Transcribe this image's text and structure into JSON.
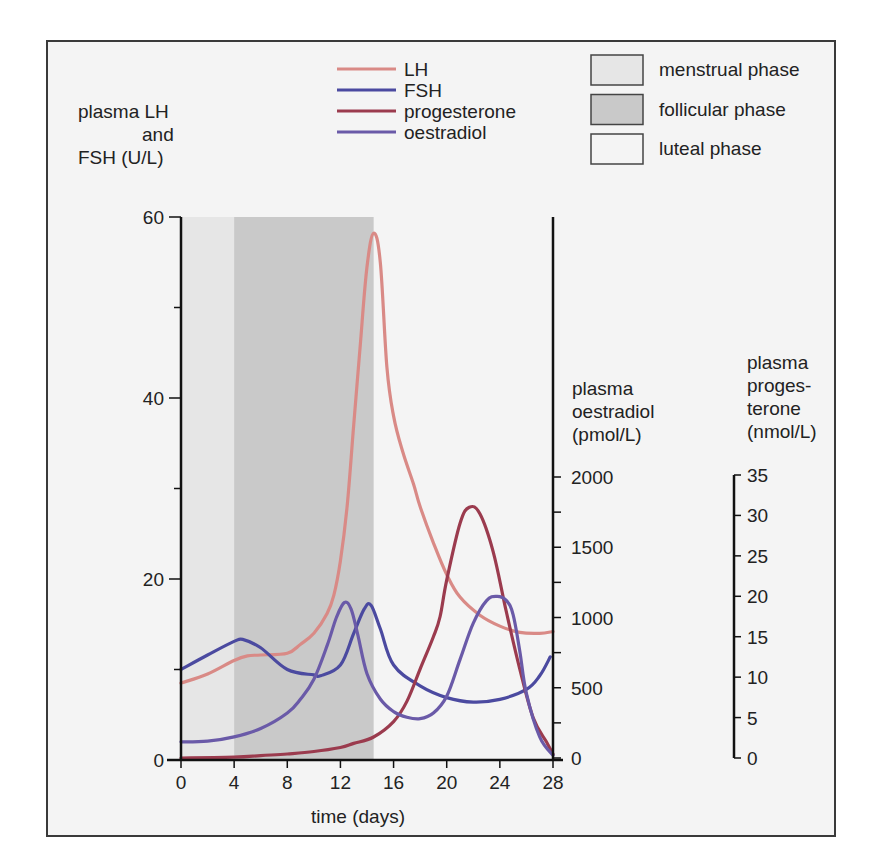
{
  "chart_data": {
    "type": "line",
    "title": "",
    "xlabel": "time (days)",
    "xlim": [
      0,
      28
    ],
    "xticks": [
      0,
      4,
      8,
      12,
      16,
      20,
      24,
      28
    ],
    "axes": {
      "left": {
        "label_lines": [
          "plasma LH",
          "and",
          "FSH (U/L)"
        ],
        "range": [
          0,
          60
        ],
        "ticks": [
          0,
          20,
          40,
          60
        ],
        "minor_ticks": [
          10,
          30,
          50
        ]
      },
      "right_oestradiol": {
        "label_lines": [
          "plasma",
          "oestradiol",
          "(pmol/L)"
        ],
        "range": [
          0,
          2000
        ],
        "ticks": [
          0,
          500,
          1000,
          1500,
          2000
        ],
        "minor_ticks": [
          250,
          750,
          1250,
          1750
        ]
      },
      "right_progesterone": {
        "label_lines": [
          "plasma",
          "proges-",
          "terone",
          "(nmol/L)"
        ],
        "range": [
          0,
          35
        ],
        "ticks": [
          0,
          5,
          10,
          15,
          20,
          25,
          30,
          35
        ]
      }
    },
    "phases": [
      {
        "name": "menstrual phase",
        "start": 0,
        "end": 4,
        "color": "#e6e6e6"
      },
      {
        "name": "follicular phase",
        "start": 4,
        "end": 14.5,
        "color": "#c9c9c9"
      },
      {
        "name": "luteal phase",
        "start": 14.5,
        "end": 28,
        "color": "#f4f4f4"
      }
    ],
    "series": [
      {
        "name": "LH",
        "axis": "left",
        "color": "#d98a86",
        "x": [
          0,
          2,
          4,
          5,
          6,
          8,
          9,
          10,
          11,
          11.5,
          12,
          12.5,
          13,
          13.5,
          14,
          14.5,
          15,
          15.5,
          16,
          16.7,
          17.5,
          18,
          19,
          20,
          21,
          22.5,
          24,
          25.5,
          27,
          28
        ],
        "y": [
          8.5,
          9.5,
          11,
          11.5,
          11.6,
          11.8,
          12.8,
          14,
          16.2,
          18.2,
          22,
          28,
          37,
          46,
          54.5,
          58.2,
          55,
          43.4,
          38,
          34,
          30.5,
          28,
          24,
          20.5,
          18,
          16,
          14.8,
          14.1,
          14,
          14.2
        ]
      },
      {
        "name": "FSH",
        "axis": "left",
        "color": "#4b4aa0",
        "x": [
          0,
          2,
          4,
          4.7,
          6,
          8,
          10,
          10.5,
          12,
          13,
          13.8,
          14.3,
          15,
          16,
          18,
          20,
          22,
          24,
          26,
          27,
          27.8
        ],
        "y": [
          10,
          11.6,
          13.1,
          13.3,
          12.4,
          10,
          9.4,
          9.3,
          10.5,
          14,
          16.7,
          17.1,
          14.5,
          10.5,
          8.2,
          6.9,
          6.4,
          6.7,
          7.8,
          9.3,
          11.4
        ]
      },
      {
        "name": "progesterone",
        "axis": "right_progesterone",
        "color": "#9b3b4e",
        "x": [
          0,
          4,
          6,
          8,
          10,
          12,
          13,
          14.5,
          16,
          17,
          18,
          19,
          19.5,
          20,
          21,
          21.7,
          22.5,
          23.5,
          24.5,
          25.5,
          26.5,
          27.5,
          28
        ],
        "y": [
          0,
          0.1,
          0.3,
          0.5,
          0.8,
          1.3,
          1.8,
          2.6,
          4.5,
          7,
          11,
          15,
          17.5,
          22,
          29,
          31,
          30.2,
          25.5,
          18,
          11,
          5,
          2,
          0.5
        ]
      },
      {
        "name": "oestradiol",
        "axis": "right_oestradiol",
        "color": "#6a5aa8",
        "x": [
          0,
          2,
          4,
          6,
          8,
          9,
          10,
          11,
          11.7,
          12.3,
          12.8,
          13.3,
          14,
          15,
          16,
          17,
          18,
          19,
          20,
          21,
          22,
          23,
          23.8,
          24.5,
          25,
          25.5,
          26,
          27,
          28
        ],
        "y": [
          115,
          120,
          150,
          210,
          320,
          420,
          560,
          800,
          1000,
          1107,
          1060,
          880,
          600,
          420,
          330,
          290,
          280,
          320,
          440,
          700,
          960,
          1120,
          1150,
          1120,
          1020,
          760,
          460,
          150,
          20
        ]
      }
    ]
  },
  "legend_lines": [
    {
      "label": "LH",
      "series": "LH"
    },
    {
      "label": "FSH",
      "series": "FSH"
    },
    {
      "label": "progesterone",
      "series": "progesterone"
    },
    {
      "label": "oestradiol",
      "series": "oestradiol"
    }
  ],
  "legend_phases": [
    {
      "label": "menstrual phase"
    },
    {
      "label": "follicular phase"
    },
    {
      "label": "luteal phase"
    }
  ]
}
